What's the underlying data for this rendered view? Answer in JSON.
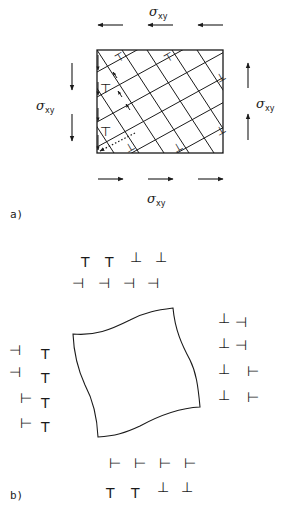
{
  "figure": {
    "panel_a": {
      "label": "a)",
      "stress_symbol": "σ",
      "stress_subscript": "xy",
      "labels": {
        "top": {
          "sym": "σ",
          "sub": "xy"
        },
        "bottom": {
          "sym": "σ",
          "sub": "xy"
        },
        "left": {
          "sym": "σ",
          "sub": "xy"
        },
        "right": {
          "sym": "σ",
          "sub": "xy"
        }
      },
      "arrows": {
        "top": "left",
        "bottom": "right",
        "left": "down",
        "right": "up"
      },
      "dislocation_marks": [
        "⊤",
        "⊤",
        "⊥",
        "⊤",
        "⊤",
        "⊥",
        "⊥",
        "⊥"
      ]
    },
    "panel_b": {
      "label": "b)",
      "top_array": {
        "row1": [
          "T",
          "T",
          "⊥",
          "⊥"
        ],
        "row2": [
          "⊣",
          "⊣",
          "⊣",
          "⊣"
        ]
      },
      "left_array": {
        "col1": [
          "⊣",
          "⊣",
          "⊢",
          "⊢"
        ],
        "col2": [
          "T",
          "T",
          "T",
          "T"
        ]
      },
      "right_array": {
        "col1": [
          "⊥",
          "⊥",
          "⊥",
          "⊥"
        ],
        "col2": [
          "⊣",
          "⊣",
          "⊢",
          "⊢"
        ]
      },
      "bottom_array": {
        "row1": [
          "⊢",
          "⊢",
          "⊢",
          "⊢"
        ],
        "row2": [
          "T",
          "T",
          "⊥",
          "⊥"
        ]
      }
    },
    "colors": {
      "ink": "#1a1a1a",
      "background": "#ffffff"
    }
  }
}
